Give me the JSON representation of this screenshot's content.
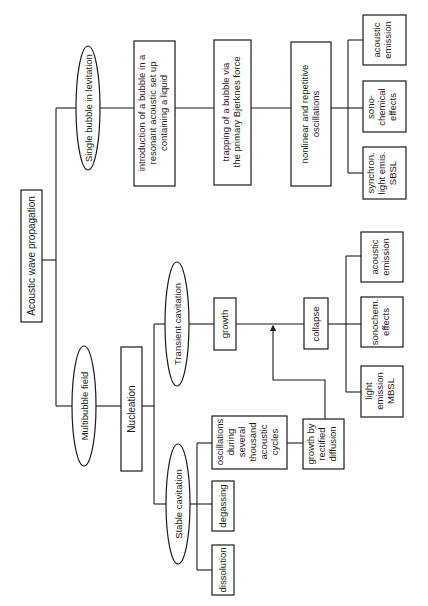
{
  "diagram": {
    "orientation": "rotated-90-ccw",
    "colors": {
      "stroke": "#1a1a1a",
      "background": "#ffffff"
    },
    "root": {
      "label": "Acoustic wave propagation"
    },
    "single_bubble": {
      "label": "Single bubble in levitation",
      "steps": [
        {
          "lines": [
            "introduction of a bubble in a",
            "resonant acoustic set up",
            "containing a liquid"
          ]
        },
        {
          "lines": [
            "trapping of a bubble via",
            "the primary Bjerknes force"
          ]
        },
        {
          "lines": [
            "nonlinear and repetitive",
            "oscillations"
          ]
        }
      ],
      "effects": [
        {
          "lines": [
            "synchron.",
            "light emis.",
            "SBSL"
          ]
        },
        {
          "lines": [
            "sono-",
            "chemical",
            "effects"
          ]
        },
        {
          "lines": [
            "acoustic",
            "emission"
          ]
        }
      ]
    },
    "multibubble": {
      "label": "Multibubble field",
      "nucleation": {
        "label": "Nucleation"
      },
      "transient": {
        "label": "Transient cavitation",
        "growth": {
          "label": "growth"
        },
        "collapse": {
          "label": "collapse"
        },
        "effects": [
          {
            "lines": [
              "light",
              "emission",
              "MBSL"
            ]
          },
          {
            "lines": [
              "sonochem.",
              "effects"
            ]
          },
          {
            "lines": [
              "acoustic",
              "emission"
            ]
          }
        ]
      },
      "stable": {
        "label": "Stable cavitation",
        "dissolution": {
          "label": "dissolution"
        },
        "degassing": {
          "label": "degassing"
        },
        "oscillations": {
          "lines": [
            "oscillations",
            "during",
            "several",
            "thousand",
            "acoustic",
            "cycles"
          ]
        },
        "rectified": {
          "lines": [
            "growth by",
            "rectified",
            "diffusion"
          ]
        }
      }
    }
  }
}
